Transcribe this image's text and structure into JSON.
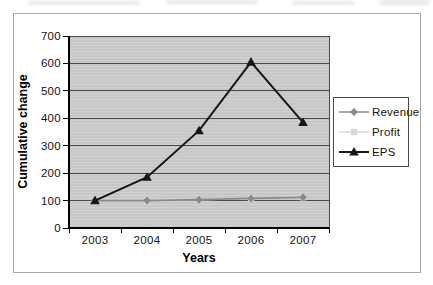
{
  "figure": {
    "border_color": "#a6a6a6",
    "background": "#ffffff"
  },
  "chart_data": {
    "type": "line",
    "title": "",
    "xlabel": "Years",
    "ylabel": "Cumulative change",
    "categories": [
      "2003",
      "2004",
      "2005",
      "2006",
      "2007"
    ],
    "yticks": [
      0,
      100,
      200,
      300,
      400,
      500,
      600,
      700
    ],
    "ylim": [
      0,
      700
    ],
    "grid": "horizontal",
    "legend_position": "right",
    "plot_bg_color": "#cbcbcb",
    "gridline_color": "#4a4a4a",
    "axis_color": "#000000",
    "draw_order": [
      1,
      0,
      2
    ],
    "series": [
      {
        "name": "Revenue",
        "values": [
          100,
          100,
          103,
          108,
          112
        ],
        "color": "#8a8a8a",
        "marker": "diamond",
        "line_width": 1.75
      },
      {
        "name": "Profit",
        "values": [
          100,
          100,
          103,
          108,
          112
        ],
        "color": "#d9d9d9",
        "marker": "square",
        "line_width": 1.5,
        "note": "coincides with Revenue; hidden behind it in plot area"
      },
      {
        "name": "EPS",
        "values": [
          100,
          185,
          355,
          605,
          385
        ],
        "color": "#161616",
        "marker": "triangle",
        "line_width": 2
      }
    ]
  }
}
